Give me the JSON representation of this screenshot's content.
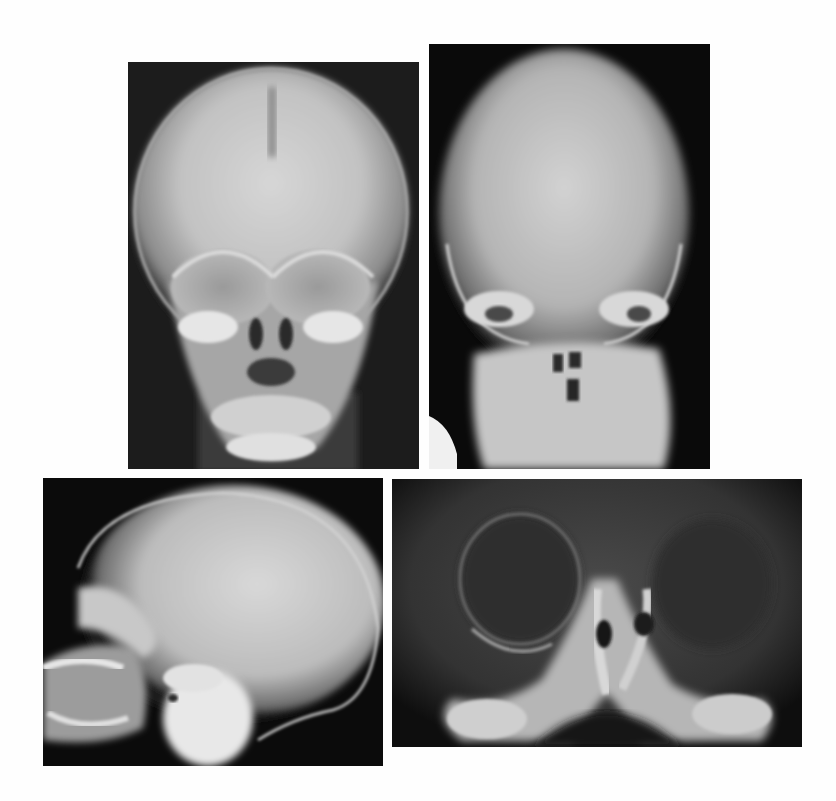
{
  "figure": {
    "background": "#fefefe",
    "panels": [
      {
        "id": "frontal-skull",
        "view": "frontal (PA) skull radiograph",
        "x": 128,
        "y": 62,
        "width": 291,
        "height": 407
      },
      {
        "id": "towne-skull",
        "view": "half-axial (Towne) skull radiograph",
        "x": 429,
        "y": 44,
        "width": 281,
        "height": 425
      },
      {
        "id": "lateral-skull",
        "view": "lateral skull radiograph",
        "x": 43,
        "y": 478,
        "width": 340,
        "height": 288
      },
      {
        "id": "orbit-closeup",
        "view": "close-up frontal view of orbits and nasal cavity",
        "x": 392,
        "y": 479,
        "width": 410,
        "height": 268
      }
    ]
  }
}
